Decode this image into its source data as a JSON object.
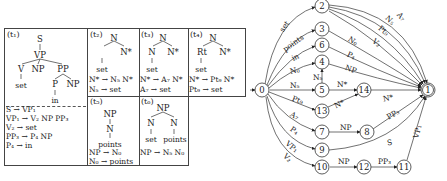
{
  "trees": [
    {
      "id": "t1",
      "label": "(t₁)",
      "nodes": [
        "S",
        "VP",
        "V",
        "NP",
        "PP",
        "set",
        "P",
        "NP",
        "in"
      ],
      "rules": [
        "S → VP₁",
        "VP₁ → V₂ NP PP₃",
        "V₂ → set",
        "PP₃ → P₄ NP",
        "P₄ → in"
      ]
    },
    {
      "id": "t2",
      "label": "(t₂)",
      "nodes": [
        "N",
        "N*",
        "set"
      ],
      "rules": [
        "N* → N₅ N*",
        "N₅ → set"
      ]
    },
    {
      "id": "t3",
      "label": "(t₃)",
      "nodes": [
        "N",
        "N",
        "N*",
        "set"
      ],
      "rules": [
        "N* → A₇ N*",
        "A₇ → set"
      ]
    },
    {
      "id": "t4",
      "label": "(t₄)",
      "nodes": [
        "N",
        "Rt",
        "N*",
        "set"
      ],
      "rules": [
        "N* → Pt₉ N*",
        "Pt₉ → set"
      ]
    },
    {
      "id": "t5",
      "label": "(t₅)",
      "nodes": [
        "NP",
        "N",
        "points"
      ],
      "rules": [
        "NP → N₀",
        "N₀ → points"
      ]
    },
    {
      "id": "t6",
      "label": "(t₆)",
      "nodes": [
        "NP",
        "N",
        "N",
        "set",
        "points"
      ],
      "rules": [
        "NP → N₅ N₀"
      ]
    }
  ],
  "graph": {
    "nodes": [
      "0",
      "1",
      "2",
      "3",
      "4",
      "5",
      "6",
      "7",
      "8",
      "9",
      "10",
      "11",
      "12",
      "13",
      "14"
    ],
    "edges": [
      {
        "from": "0",
        "to": "2",
        "label": "set"
      },
      {
        "from": "0",
        "to": "3",
        "label": "points"
      },
      {
        "from": "0",
        "to": "6",
        "label": "in"
      },
      {
        "from": "0",
        "to": "4",
        "label": "N₀"
      },
      {
        "from": "0",
        "to": "5",
        "label": "N₅"
      },
      {
        "from": "0",
        "to": "13",
        "label": "Pt₉"
      },
      {
        "from": "0",
        "to": "7",
        "label": "A₇"
      },
      {
        "from": "0",
        "to": "9",
        "label": "P₄"
      },
      {
        "from": "0",
        "to": "10",
        "label": "VP₁"
      },
      {
        "from": "0",
        "to": "10",
        "label": "V₂"
      },
      {
        "from": "5",
        "to": "4",
        "label": "N₅"
      },
      {
        "from": "5",
        "to": "14",
        "label": "N*"
      },
      {
        "from": "13",
        "to": "14",
        "label": "N*"
      },
      {
        "from": "14",
        "to": "1",
        "label": "N*"
      },
      {
        "from": "2",
        "to": "1",
        "label": "A₇"
      },
      {
        "from": "2",
        "to": "1",
        "label": "N₅"
      },
      {
        "from": "2",
        "to": "1",
        "label": "Pt₉"
      },
      {
        "from": "2",
        "to": "1",
        "label": "V₂"
      },
      {
        "from": "3",
        "to": "1",
        "label": "N₀"
      },
      {
        "from": "6",
        "to": "1",
        "label": "P₄"
      },
      {
        "from": "4",
        "to": "1",
        "label": "NP"
      },
      {
        "from": "7",
        "to": "8",
        "label": "NP"
      },
      {
        "from": "8",
        "to": "1",
        "label": "PP₃"
      },
      {
        "from": "9",
        "to": "1",
        "label": "S"
      },
      {
        "from": "10",
        "to": "12",
        "label": "NP"
      },
      {
        "from": "12",
        "to": "11",
        "label": "PP₃"
      },
      {
        "from": "11",
        "to": "1",
        "label": "VP₁"
      }
    ]
  }
}
